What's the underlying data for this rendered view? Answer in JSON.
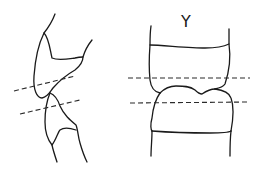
{
  "figure": {
    "width": 262,
    "height": 173,
    "background": "#ffffff",
    "stroke_color": "#1a1a1a",
    "left_figure": {
      "label": "",
      "upper_bone": "M55,14 C52,22 48,28 44,33 C38,45 35,62 34,76 C33,90 37,98 42,98 C48,97 50,92 53,88 C60,80 68,74 75,70 C80,66 83,62 83,57 C85,50 88,45 92,40",
      "upper_notch": "M44,33 C49,38 50,50 52,58 C58,61 68,59 75,58 C79,57 82,57 83,57",
      "lower_bone": "M50,93 C47,100 45,110 45,122 C45,132 48,140 52,145 C53,150 55,156 57,162",
      "lower_right": "M50,93 C55,95 58,100 60,106 C64,115 70,120 76,125 C78,130 78,137 80,143 C82,150 84,156 87,162",
      "lower_notch": "M52,145 C56,140 58,132 60,130 C64,127 70,128 76,130",
      "dashes": [
        {
          "x1": 14,
          "y1": 91,
          "x2": 75,
          "y2": 76
        },
        {
          "x1": 20,
          "y1": 114,
          "x2": 80,
          "y2": 100
        }
      ]
    },
    "right_figure": {
      "mark_text": "Y",
      "upper_body": "M150,45 C160,45 190,48 205,48 C215,48 225,46 229,44",
      "upper_left_side": "M151,26 C150,33 150,40 150,45 C149,58 149,70 150,80 C151,88 155,92 160,93",
      "upper_right_side": "M229,29 C229,36 229,40 229,44 C231,58 229,72 225,84 C223,87 220,88 215,89",
      "joint_line": "M160,93 C165,88 170,86 176,86 C183,86 190,86 195,90 C198,93 200,94 202,94 C205,92 210,89 215,89",
      "lower_body_left": "M160,93 C155,100 153,108 152,118 C150,125 151,130 152,131",
      "lower_body_right": "M215,89 C223,90 229,92 231,98 C234,106 233,120 231,131",
      "lower_endplate": "M152,131 C165,132 190,133 210,133 C220,133 228,133 231,131",
      "lower_left_side": "M152,131 C152,140 151,148 151,156",
      "lower_right_side": "M231,131 C230,140 230,148 230,156",
      "dashes": [
        {
          "x1": 128,
          "y1": 78,
          "x2": 250,
          "y2": 78
        },
        {
          "x1": 130,
          "y1": 103,
          "x2": 250,
          "y2": 102
        }
      ],
      "mark_position": {
        "x": 186,
        "y": 27
      }
    }
  }
}
